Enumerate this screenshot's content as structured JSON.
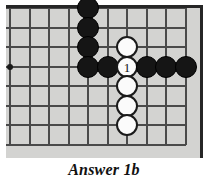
{
  "figure": {
    "type": "go-board-diagram",
    "caption": "Answer 1b",
    "board": {
      "background_color": "#d3d3d1",
      "line_color": "#4a4a4a",
      "edge_color": "#262626",
      "edge_top_visible": true,
      "edge_right_visible": true,
      "edge_left_visible": false,
      "edge_bottom_visible": false,
      "columns": 10,
      "rows": 8,
      "cell_size_px": 19.5,
      "origin_x_px": 10,
      "origin_y_px": 8,
      "star_points": [
        {
          "col": 0,
          "row": 3
        }
      ]
    },
    "stones": [
      {
        "color": "black",
        "col": 4,
        "row": 0,
        "label": ""
      },
      {
        "color": "black",
        "col": 4,
        "row": 1,
        "label": ""
      },
      {
        "color": "black",
        "col": 4,
        "row": 2,
        "label": ""
      },
      {
        "color": "black",
        "col": 4,
        "row": 3,
        "label": ""
      },
      {
        "color": "black",
        "col": 5,
        "row": 3,
        "label": ""
      },
      {
        "color": "white",
        "col": 6,
        "row": 2,
        "label": ""
      },
      {
        "color": "white",
        "col": 6,
        "row": 3,
        "label": "1"
      },
      {
        "color": "white",
        "col": 6,
        "row": 4,
        "label": ""
      },
      {
        "color": "white",
        "col": 6,
        "row": 5,
        "label": ""
      },
      {
        "color": "white",
        "col": 6,
        "row": 6,
        "label": ""
      },
      {
        "color": "black",
        "col": 7,
        "row": 3,
        "label": ""
      },
      {
        "color": "black",
        "col": 8,
        "row": 3,
        "label": ""
      },
      {
        "color": "black",
        "col": 9,
        "row": 3,
        "label": ""
      }
    ],
    "move_numbers": [
      {
        "number": "1",
        "stone_color": "white",
        "col": 6,
        "row": 3
      }
    ]
  }
}
